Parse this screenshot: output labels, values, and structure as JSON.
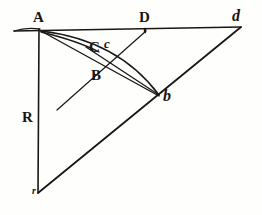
{
  "figure": {
    "background_color": "#fefefc",
    "ink_color": "#1a1714",
    "labels": [
      {
        "key": "A",
        "text": "A",
        "x": 33,
        "y": 10,
        "style": "roman",
        "name": "point-label-A"
      },
      {
        "key": "D",
        "text": "D",
        "x": 139,
        "y": 10,
        "style": "roman",
        "name": "point-label-D"
      },
      {
        "key": "d",
        "text": "d",
        "x": 232,
        "y": 8,
        "style": "italic",
        "name": "point-label-d-italic"
      },
      {
        "key": "Cc",
        "text": "C",
        "x": 89,
        "y": 40,
        "style": "roman",
        "name": "point-label-C"
      },
      {
        "key": "c",
        "text": "c",
        "x": 104,
        "y": 37,
        "style": "italic-sm",
        "name": "point-label-c-italic"
      },
      {
        "key": "B",
        "text": "B",
        "x": 91,
        "y": 68,
        "style": "roman",
        "name": "point-label-B"
      },
      {
        "key": "R",
        "text": "R",
        "x": 22,
        "y": 110,
        "style": "roman",
        "name": "point-label-R"
      },
      {
        "key": "b",
        "text": "b",
        "x": 163,
        "y": 88,
        "style": "italic",
        "name": "point-label-b-italic"
      },
      {
        "key": "r",
        "text": "r",
        "x": 32,
        "y": 186,
        "style": "tiny",
        "name": "point-label-r-italic"
      }
    ],
    "points": {
      "A": {
        "x": 39,
        "y": 29
      },
      "D": {
        "x": 145,
        "y": 30
      },
      "d": {
        "x": 240,
        "y": 28
      },
      "B": {
        "x": 101,
        "y": 63
      },
      "C": {
        "x": 97,
        "y": 48
      },
      "c": {
        "x": 110,
        "y": 44
      },
      "b": {
        "x": 159,
        "y": 96
      },
      "R": {
        "x": 39,
        "y": 193
      },
      "r": {
        "x": 39,
        "y": 193
      }
    },
    "segments": [
      {
        "name": "horizontal-baseline-A-to-d",
        "x1": 14,
        "y1": 31,
        "x2": 241,
        "y2": 27,
        "width": 1.5
      },
      {
        "name": "vertical-radius-A-to-r",
        "x1": 39,
        "y1": 29,
        "x2": 38,
        "y2": 193,
        "width": 1.6
      },
      {
        "name": "hypotenuse-r-to-d",
        "x1": 38,
        "y1": 193,
        "x2": 241,
        "y2": 27,
        "width": 1.8
      },
      {
        "name": "chord-A-to-b",
        "x1": 41,
        "y1": 31,
        "x2": 159,
        "y2": 96,
        "width": 1.4
      },
      {
        "name": "ray-R-to-D",
        "x1": 57,
        "y1": 110,
        "x2": 146,
        "y2": 31,
        "width": 1.2
      },
      {
        "name": "chord-b-to-c-upper",
        "x1": 159,
        "y1": 95,
        "x2": 86,
        "y2": 47,
        "width": 1.3
      },
      {
        "name": "tick-at-D",
        "x1": 145,
        "y1": 29,
        "x2": 145,
        "y2": 32,
        "width": 2.4
      }
    ],
    "arcs": [
      {
        "name": "arc-A-to-b-outer",
        "d": "M 41 31 Q 118 40 159 95",
        "width": 1.5
      },
      {
        "name": "arc-A-to-C-inner",
        "d": "M 41 32 Q 78 41 99 52",
        "width": 1.4
      },
      {
        "name": "arc-baseline-left-curl",
        "d": "M 14 31 Q 26 27 40 29",
        "width": 1.3
      }
    ]
  }
}
